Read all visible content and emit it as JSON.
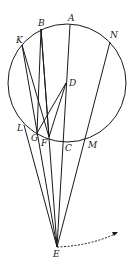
{
  "diagram": {
    "circle": {
      "cx": 67,
      "cy": 83,
      "r": 59
    },
    "points": {
      "A": {
        "x": 70,
        "y": 25,
        "label": "A",
        "lx": 68,
        "ly": 14
      },
      "B": {
        "x": 41,
        "y": 29,
        "label": "B",
        "lx": 38,
        "ly": 19
      },
      "K": {
        "x": 22,
        "y": 45,
        "label": "K",
        "lx": 16,
        "ly": 36
      },
      "N": {
        "x": 110,
        "y": 42,
        "label": "N",
        "lx": 110,
        "ly": 31
      },
      "D": {
        "x": 66,
        "y": 83,
        "label": "D",
        "lx": 69,
        "ly": 79
      },
      "L": {
        "x": 24,
        "y": 125,
        "label": "L",
        "lx": 17,
        "ly": 124
      },
      "G": {
        "x": 37,
        "y": 133,
        "label": "G",
        "lx": 31,
        "ly": 134
      },
      "F": {
        "x": 49,
        "y": 137,
        "label": "F",
        "lx": 41,
        "ly": 139
      },
      "C": {
        "x": 65,
        "y": 141,
        "label": "C",
        "lx": 65,
        "ly": 144
      },
      "M": {
        "x": 85,
        "y": 138,
        "label": "M",
        "lx": 88,
        "ly": 141
      },
      "E": {
        "x": 57,
        "y": 247,
        "label": "E",
        "lx": 53,
        "ly": 250
      }
    },
    "segments": [
      [
        "A",
        "E"
      ],
      [
        "B",
        "E"
      ],
      [
        "K",
        "E"
      ],
      [
        "N",
        "E"
      ],
      [
        "L",
        "E"
      ],
      [
        "K",
        "F"
      ],
      [
        "B",
        "F"
      ],
      [
        "B",
        "G"
      ],
      [
        "D",
        "G"
      ],
      [
        "D",
        "F"
      ]
    ],
    "dashed_arrow": {
      "from": [
        57,
        247
      ],
      "ctrl": [
        90,
        246
      ],
      "to": [
        117,
        233
      ]
    },
    "colors": {
      "stroke": "#1a1a1a",
      "background": "#ffffff"
    }
  }
}
